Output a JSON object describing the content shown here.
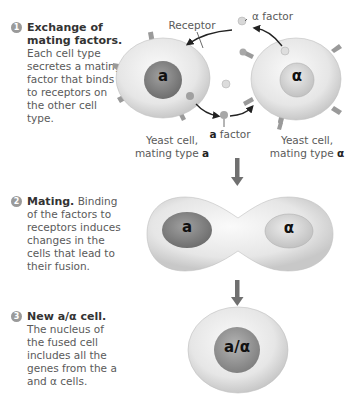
{
  "steps": [
    {
      "number": "1",
      "title": "Exchange of mating factors.",
      "body": "Each cell type secretes a mating factor that binds to receptors on the other cell type."
    },
    {
      "number": "2",
      "title": "Mating.",
      "body": "Binding of the factors to receptors induces changes in the cells that lead to their fusion."
    },
    {
      "number": "3",
      "title": "New a/α cell.",
      "body": "The nucleus of the fused cell includes all the genes from the a and α cells."
    }
  ],
  "labels": {
    "receptor": "Receptor",
    "alpha_factor": "α factor",
    "a_factor_bold": "a",
    "a_factor_rest": " factor",
    "cell_a_line1": "Yeast cell,",
    "cell_a_line2": "mating type ",
    "cell_a_type": "a",
    "cell_alpha_line1": "Yeast cell,",
    "cell_alpha_line2": "mating type ",
    "cell_alpha_type": "α"
  },
  "nuclei": {
    "cell_a": "a",
    "cell_alpha": "α",
    "fused_a": "a",
    "fused_alpha": "α",
    "diploid": "a/α"
  },
  "colors": {
    "cell_fill": "#e8e8e8",
    "nucleus_a": "#8a8a8a",
    "nucleus_alpha": "#d2d2d2",
    "arrow": "#707070",
    "receptor": "#9a9a9a"
  }
}
